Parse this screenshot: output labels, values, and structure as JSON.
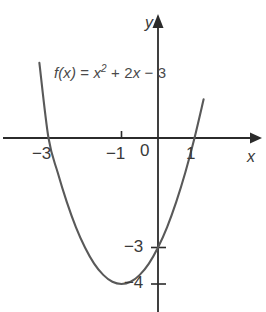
{
  "figure": {
    "equation_prefix": "f",
    "equation_text": "f(x) = x2 + 2x − 3",
    "background_color": "#ffffff",
    "curve_color": "#595959",
    "axis_color": "#2b2b2b",
    "text_color": "#3a3a3a"
  },
  "axes": {
    "x_name": "x",
    "y_name": "y",
    "origin_label": "0",
    "x_tick_labels": [
      "−3",
      "−1",
      "1"
    ],
    "y_tick_labels": [
      "−3",
      "−4"
    ],
    "x_ticks": [
      -3,
      -1,
      1
    ],
    "y_ticks": [
      -3,
      -4
    ]
  },
  "equation_parts": {
    "fx": "f(x)",
    "equals": "=",
    "x_var": "x",
    "exponent": "2",
    "plus_term": "+ 2",
    "x_var2": "x",
    "minus_const": "− 3"
  },
  "chart_data": {
    "type": "line",
    "function": "f(x) = x^2 + 2x - 3",
    "xlabel": "x",
    "ylabel": "y",
    "xlim": [
      -4.25,
      2.55
    ],
    "ylim": [
      -4.75,
      2.1
    ],
    "grid": false,
    "legend": "none",
    "roots": [
      -3,
      1
    ],
    "y_intercept": -3,
    "vertex": [
      -1,
      -4
    ],
    "axis_of_symmetry": -1,
    "x": [
      -3.55,
      -3.25,
      -3.0,
      -2.75,
      -2.5,
      -2.25,
      -2.0,
      -1.75,
      -1.5,
      -1.25,
      -1.0,
      -0.75,
      -0.5,
      -0.25,
      0.0,
      0.25,
      0.5,
      0.75,
      1.0,
      1.25,
      1.5,
      1.55
    ],
    "y": [
      3.51,
      2.06,
      0.0,
      -0.94,
      -1.75,
      -2.44,
      -3.0,
      -3.44,
      -3.75,
      -3.94,
      -4.0,
      -3.94,
      -3.75,
      -3.44,
      -3.0,
      -2.44,
      -1.75,
      -0.94,
      0.0,
      1.06,
      2.25,
      2.6
    ],
    "annotations": [
      {
        "text": "−3",
        "x": -3,
        "y": 0,
        "role": "x-intercept-label"
      },
      {
        "text": "−1",
        "x": -1,
        "y": 0,
        "role": "x-tick-label"
      },
      {
        "text": "0",
        "x": 0,
        "y": 0,
        "role": "origin-label"
      },
      {
        "text": "1",
        "x": 1,
        "y": 0,
        "role": "x-intercept-label"
      },
      {
        "text": "−3",
        "x": 0,
        "y": -3,
        "role": "y-intercept-label"
      },
      {
        "text": "−4",
        "x": 0,
        "y": -4,
        "role": "vertex-label"
      }
    ]
  }
}
